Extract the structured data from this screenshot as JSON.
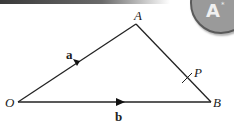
{
  "diagram": {
    "type": "vector-triangle",
    "points": {
      "O": {
        "label": "O",
        "x": 18,
        "y": 102
      },
      "A": {
        "label": "A",
        "x": 136,
        "y": 24
      },
      "B": {
        "label": "B",
        "x": 211,
        "y": 102
      },
      "P": {
        "label": "P",
        "x": 187,
        "y": 78
      }
    },
    "vectors": {
      "a": {
        "label": "a",
        "from": "O",
        "to": "A"
      },
      "b": {
        "label": "b",
        "from": "O",
        "to": "B"
      }
    },
    "line_color": "#222222"
  },
  "badge": {
    "icon": "castle-icon",
    "glyph": "A",
    "star": "*",
    "color": "#9a9a9a"
  }
}
